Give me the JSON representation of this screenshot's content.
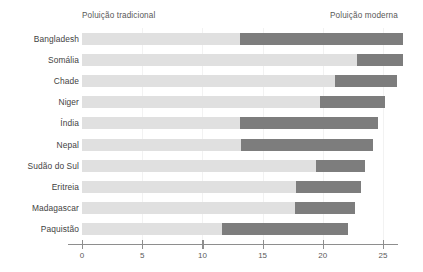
{
  "chart_data": {
    "type": "bar",
    "orientation": "horizontal",
    "stacked": true,
    "title": "",
    "subtitle": "",
    "xlabel": "",
    "ylabel": "",
    "xlim": [
      0,
      27.5
    ],
    "grid": true,
    "legend_position": "top",
    "categories": [
      "Bangladesh",
      "Somália",
      "Chade",
      "Niger",
      "Índia",
      "Nepal",
      "Sudão do Sul",
      "Eritreia",
      "Madagascar",
      "Paquistão"
    ],
    "series": [
      {
        "name": "Poluição tradicional",
        "color": "#e0e0e0",
        "values": [
          13.1,
          22.8,
          21.0,
          19.8,
          13.1,
          13.2,
          19.4,
          17.8,
          17.7,
          11.6
        ]
      },
      {
        "name": "Poluição moderna",
        "color": "#7d7d7d",
        "values": [
          13.6,
          3.9,
          5.2,
          5.4,
          11.5,
          11.0,
          4.1,
          5.4,
          5.0,
          10.5
        ]
      }
    ],
    "totals": [
      26.7,
      26.7,
      26.2,
      25.2,
      24.6,
      24.2,
      23.5,
      23.2,
      22.7,
      22.1
    ],
    "xticks": [
      0,
      5,
      10,
      15,
      20,
      25
    ],
    "xticklabels": [
      "0",
      "5",
      "10",
      "15",
      "20",
      "25"
    ]
  },
  "legend": {
    "traditional_label": "Poluição tradicional",
    "modern_label": "Poluição moderna"
  },
  "colors": {
    "traditional": "#e0e0e0",
    "modern": "#7d7d7d",
    "axis": "#8e8e8e",
    "grid": "#f2f2f2",
    "text": "#3f3f3f",
    "background": "#ffffff"
  }
}
